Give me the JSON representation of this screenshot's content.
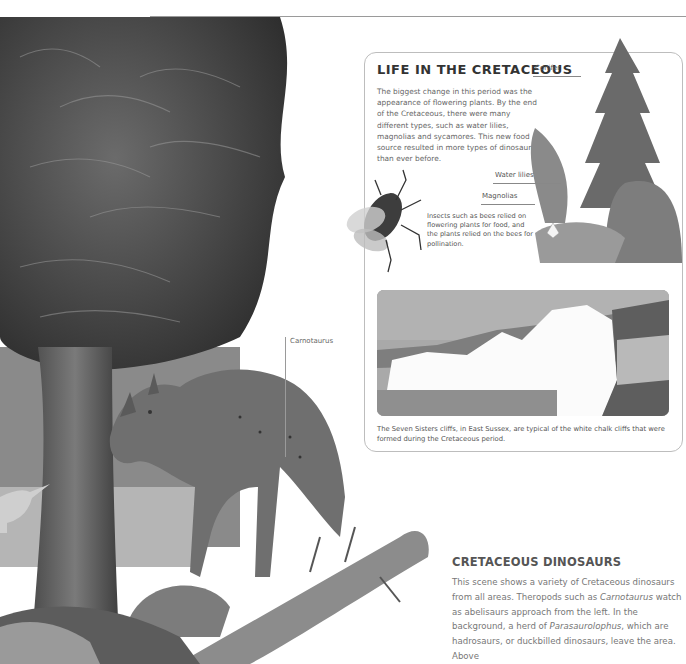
{
  "illustration": {
    "callout": {
      "label": "Carnotaurus"
    }
  },
  "life_box": {
    "title": "LIFE IN THE CRETACEOUS",
    "body": "The biggest change in this period was the appearance of flowering plants. By the end of the Cretaceous, there were many different types, such as water lilies, magnolias and sycamores. This new food source resulted in more types of dinosaurs than ever before.",
    "plant_labels": {
      "conifer": "Conifer",
      "water_lilies": "Water lilies",
      "magnolias": "Magnolias"
    },
    "insect_caption": "Insects such as bees relied on flowering plants for food, and the plants relied on the bees for pollination.",
    "photo_caption": "The Seven Sisters cliffs, in East Sussex, are typical of the white chalk cliffs that were formed during the Cretaceous period."
  },
  "dinosaurs_section": {
    "title": "CRETACEOUS DINOSAURS",
    "body_parts": {
      "p1": "This scene shows a variety of Cretaceous dinosaurs from all areas. Theropods such as ",
      "carnotaurus": "Carnotaurus",
      "p2": " watch as abelisaurs approach from the left. In the background, a herd of ",
      "parasaurolophus": "Parasaurolophus",
      "p3": ", which are hadrosaurs, or duckbilled dinosaurs, leave the area. Above"
    }
  }
}
